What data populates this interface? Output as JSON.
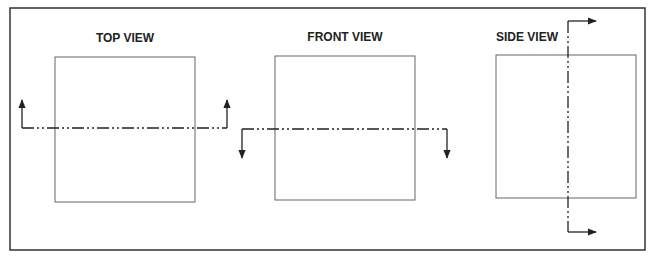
{
  "diagram": {
    "type": "orthographic-section-views",
    "frame": {
      "x": 10,
      "y": 8,
      "w": 635,
      "h": 242,
      "stroke": "#333333"
    },
    "views": [
      {
        "label": "TOP VIEW",
        "label_pos": [
          125,
          42
        ],
        "box": {
          "x": 55,
          "y": 57,
          "w": 140,
          "h": 145
        },
        "cutting_plane": {
          "orientation": "horizontal",
          "y": 128,
          "x1": 22,
          "x2": 227,
          "arrow_direction": "up",
          "arrow_tip": 100
        }
      },
      {
        "label": "FRONT VIEW",
        "label_pos": [
          345,
          41
        ],
        "box": {
          "x": 275,
          "y": 56,
          "w": 140,
          "h": 144
        },
        "cutting_plane": {
          "orientation": "horizontal",
          "y": 129,
          "x1": 242,
          "x2": 447,
          "arrow_direction": "down",
          "arrow_tip": 158
        }
      },
      {
        "label": "SIDE VIEW",
        "label_pos": [
          527,
          41
        ],
        "box": {
          "x": 496,
          "y": 55,
          "w": 140,
          "h": 143
        },
        "cutting_plane": {
          "orientation": "vertical",
          "x": 568,
          "y1": 21,
          "y2": 232,
          "arrow_direction": "right",
          "arrow_tip": 596
        }
      }
    ],
    "colors": {
      "line": "#333333",
      "box": "#666666",
      "text": "#222222"
    }
  }
}
